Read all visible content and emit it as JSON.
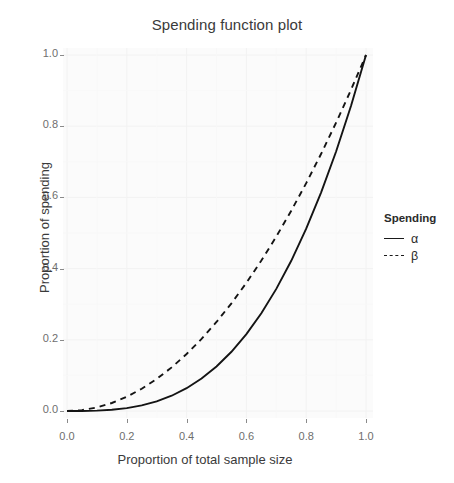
{
  "chart_data": {
    "type": "line",
    "title": "Spending function plot",
    "xlabel": "Proportion of total sample size",
    "ylabel": "Proportion of spending",
    "xlim": [
      0,
      1
    ],
    "ylim": [
      0,
      1
    ],
    "grid": true,
    "legend_position": "right",
    "legend_title": "Spending",
    "xticks": [
      "0.0",
      "0.2",
      "0.4",
      "0.6",
      "0.8",
      "1.0"
    ],
    "xtick_values": [
      0,
      0.2,
      0.4,
      0.6,
      0.8,
      1
    ],
    "yticks": [
      "0.0",
      "0.2",
      "0.4",
      "0.6",
      "0.8",
      "1.0"
    ],
    "ytick_values": [
      0,
      0.2,
      0.4,
      0.6,
      0.8,
      1
    ],
    "x": [
      0,
      0.05,
      0.1,
      0.15,
      0.2,
      0.25,
      0.3,
      0.35,
      0.4,
      0.45,
      0.5,
      0.55,
      0.6,
      0.65,
      0.7,
      0.75,
      0.8,
      0.85,
      0.9,
      0.95,
      1
    ],
    "series": [
      {
        "name": "α",
        "linestyle": "solid",
        "color": "#141414",
        "formula": "t^3",
        "values": [
          0,
          0.000125,
          0.001,
          0.003375,
          0.008,
          0.015625,
          0.027,
          0.042875,
          0.064,
          0.091125,
          0.125,
          0.166375,
          0.216,
          0.274625,
          0.343,
          0.421875,
          0.512,
          0.614125,
          0.729,
          0.857375,
          1
        ]
      },
      {
        "name": "β",
        "linestyle": "dashed",
        "color": "#141414",
        "formula": "t^2",
        "values": [
          0,
          0.0025,
          0.01,
          0.0225,
          0.04,
          0.0625,
          0.09,
          0.1225,
          0.16,
          0.2025,
          0.25,
          0.3025,
          0.36,
          0.4225,
          0.49,
          0.5625,
          0.64,
          0.7225,
          0.81,
          0.9025,
          1
        ]
      }
    ]
  },
  "legend": {
    "title": "Spending",
    "entries": [
      {
        "label": "α",
        "style": "solid"
      },
      {
        "label": "β",
        "style": "dashed"
      }
    ]
  }
}
